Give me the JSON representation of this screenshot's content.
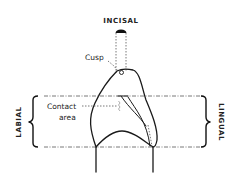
{
  "diagram": {
    "labels": {
      "incisal": "INCISAL",
      "cusp": "Cusp",
      "contact_line1": "Contact",
      "contact_line2": "area",
      "labial": "LABIAL",
      "lingual": "LINGUAL"
    },
    "colors": {
      "line": "#1a1a1a",
      "guide": "#555555",
      "background": "#ffffff"
    }
  }
}
